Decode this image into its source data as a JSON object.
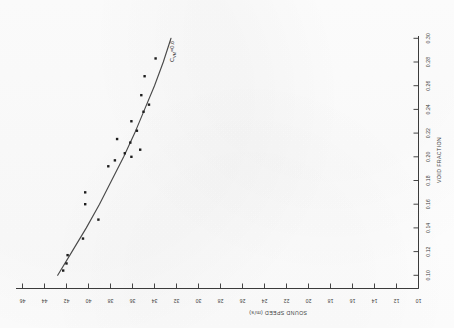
{
  "figure": {
    "orientation": "rotated-90-clockwise",
    "background_color": "#ffffff",
    "ink_color": "#333333"
  },
  "chart_data": {
    "type": "scatter",
    "title": "",
    "xlabel": "VOID FRACTION",
    "ylabel": "SOUND SPEED (m/s)",
    "xlim": [
      0.09,
      0.31
    ],
    "ylim": [
      10,
      46
    ],
    "grid": false,
    "legend_position": "none",
    "x_ticks": [
      0.1,
      0.12,
      0.14,
      0.16,
      0.18,
      0.2,
      0.22,
      0.24,
      0.26,
      0.28,
      0.3
    ],
    "x_tick_labels": [
      "0.10",
      "0.12",
      "0.14",
      "0.16",
      "0.18",
      "0.20",
      "0.22",
      "0.24",
      "0.26",
      "0.28",
      "0.30"
    ],
    "y_ticks": [
      10,
      12,
      14,
      16,
      18,
      20,
      22,
      24,
      26,
      28,
      30,
      32,
      34,
      36,
      38,
      40,
      42,
      44,
      46
    ],
    "y_tick_labels": [
      "10",
      "12",
      "14",
      "16",
      "18",
      "20",
      "22",
      "24",
      "26",
      "28",
      "30",
      "32",
      "34",
      "36",
      "38",
      "40",
      "42",
      "44",
      "46"
    ],
    "series": [
      {
        "name": "measured-data",
        "marker": "square",
        "points": [
          {
            "x": 0.104,
            "y": 42.3
          },
          {
            "x": 0.11,
            "y": 42.0
          },
          {
            "x": 0.117,
            "y": 41.9
          },
          {
            "x": 0.131,
            "y": 40.5
          },
          {
            "x": 0.147,
            "y": 39.1
          },
          {
            "x": 0.16,
            "y": 40.3
          },
          {
            "x": 0.17,
            "y": 40.3
          },
          {
            "x": 0.192,
            "y": 38.2
          },
          {
            "x": 0.197,
            "y": 37.6
          },
          {
            "x": 0.2,
            "y": 36.1
          },
          {
            "x": 0.203,
            "y": 36.7
          },
          {
            "x": 0.206,
            "y": 35.3
          },
          {
            "x": 0.212,
            "y": 36.2
          },
          {
            "x": 0.215,
            "y": 37.4
          },
          {
            "x": 0.222,
            "y": 35.6
          },
          {
            "x": 0.23,
            "y": 36.1
          },
          {
            "x": 0.238,
            "y": 35.0
          },
          {
            "x": 0.244,
            "y": 34.5
          },
          {
            "x": 0.252,
            "y": 35.2
          },
          {
            "x": 0.268,
            "y": 34.9
          },
          {
            "x": 0.283,
            "y": 33.9
          }
        ]
      }
    ],
    "curves": [
      {
        "name": "model-curve",
        "label": "C",
        "label_subscript": "VM",
        "label_suffix": "=0.6",
        "label_full": "C_VM=0.6",
        "style": "solid",
        "points": [
          {
            "x": 0.1,
            "y": 42.8
          },
          {
            "x": 0.12,
            "y": 41.5
          },
          {
            "x": 0.14,
            "y": 40.2
          },
          {
            "x": 0.16,
            "y": 39.0
          },
          {
            "x": 0.18,
            "y": 37.9
          },
          {
            "x": 0.2,
            "y": 36.8
          },
          {
            "x": 0.22,
            "y": 35.8
          },
          {
            "x": 0.24,
            "y": 34.9
          },
          {
            "x": 0.26,
            "y": 34.0
          },
          {
            "x": 0.28,
            "y": 33.2
          },
          {
            "x": 0.3,
            "y": 32.5
          }
        ]
      }
    ]
  }
}
